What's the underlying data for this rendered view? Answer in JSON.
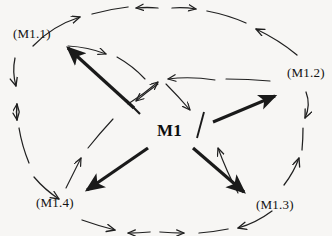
{
  "diagram": {
    "type": "radial-hub-and-spoke",
    "background_color": "#f7f6f4",
    "ink_color": "#1a1a1a",
    "center": {
      "id": "M1",
      "label": "M1",
      "x": 168,
      "y": 130
    },
    "nodes": [
      {
        "id": "M1.1",
        "label": "(M1.1)",
        "position": "top-left",
        "x": 46,
        "y": 33
      },
      {
        "id": "M1.2",
        "label": "(M1.2)",
        "position": "right",
        "x": 308,
        "y": 72
      },
      {
        "id": "M1.3",
        "label": "(M1.3)",
        "position": "bottom-right",
        "x": 282,
        "y": 204
      },
      {
        "id": "M1.4",
        "label": "(M1.4)",
        "position": "bottom-left",
        "x": 62,
        "y": 202
      }
    ],
    "spokes": [
      {
        "from": "M1",
        "to": "M1.1",
        "style": "thick-solid",
        "arrowhead": "filled",
        "direction": "outward",
        "tail": "bar"
      },
      {
        "from": "M1",
        "to": "M1.2",
        "style": "thick-solid",
        "arrowhead": "filled",
        "direction": "outward",
        "tail": "bar"
      },
      {
        "from": "M1",
        "to": "M1.3",
        "style": "thick-solid",
        "arrowhead": "filled",
        "direction": "outward",
        "tail": "bar"
      },
      {
        "from": "M1",
        "to": "M1.4",
        "style": "thick-solid",
        "arrowhead": "filled",
        "direction": "outward",
        "tail": "bar"
      }
    ],
    "outer_ring": {
      "style": "dashed-hand-drawn",
      "description": "broken elliptical ring of curved arrow segments connecting the four outer nodes, with arrowheads in both directions"
    },
    "inner_ring": {
      "style": "dashed-hand-drawn",
      "description": "broken inner elliptical ring of thin curved arrows converging toward the centre hub"
    }
  }
}
